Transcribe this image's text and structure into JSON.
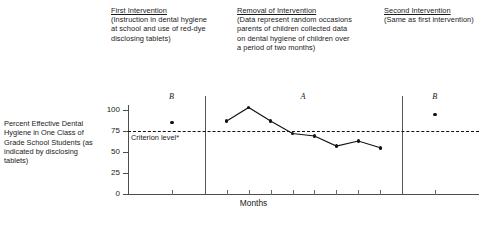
{
  "phases": {
    "first": {
      "title": "First Intervention",
      "description": "(Instruction in dental hygiene at school and use of red-dye disclosing tablets)",
      "letter": "B"
    },
    "middle": {
      "title": "Removal of Intervention",
      "description": "(Data represent random occasions parents of children collected data on dental hygiene of children over a period of two months)",
      "letter": "A"
    },
    "second": {
      "title": "Second Intervention",
      "description": "(Same as first intervention)",
      "letter": "B"
    }
  },
  "criterion": {
    "label": "Criterion level*",
    "value": 75
  },
  "chart_data": {
    "type": "line",
    "title": "",
    "xlabel": "Months",
    "ylabel": "Percent Effective Dental Hygiene in One Class of Grade School Students (as indicated by disclosing tablets)",
    "ylim": [
      0,
      110
    ],
    "yticks": [
      0,
      25,
      50,
      75,
      100
    ],
    "ytick_labels": [
      "0",
      "25",
      "50",
      "75",
      "100"
    ],
    "grid": false,
    "legend": null,
    "annotations": [
      {
        "text": "Criterion level*",
        "y": 75,
        "style": "dashed-horizontal-line"
      },
      {
        "text": "B",
        "phase": "first"
      },
      {
        "text": "A",
        "phase": "middle"
      },
      {
        "text": "B",
        "phase": "second"
      }
    ],
    "phase_dividers_x": [
      3.5,
      12.5
    ],
    "series": [
      {
        "name": "First Intervention (B)",
        "phase": "B",
        "connected": false,
        "x": [
          2
        ],
        "values": [
          85
        ]
      },
      {
        "name": "Removal of Intervention (A)",
        "phase": "A",
        "connected": true,
        "x": [
          4.5,
          5.5,
          6.5,
          7.5,
          8.5,
          9.5,
          10.5,
          11.5
        ],
        "values": [
          87,
          103,
          87,
          72,
          69,
          57,
          63,
          55
        ]
      },
      {
        "name": "Second Intervention (B)",
        "phase": "B",
        "connected": false,
        "x": [
          14
        ],
        "values": [
          95
        ]
      }
    ]
  }
}
